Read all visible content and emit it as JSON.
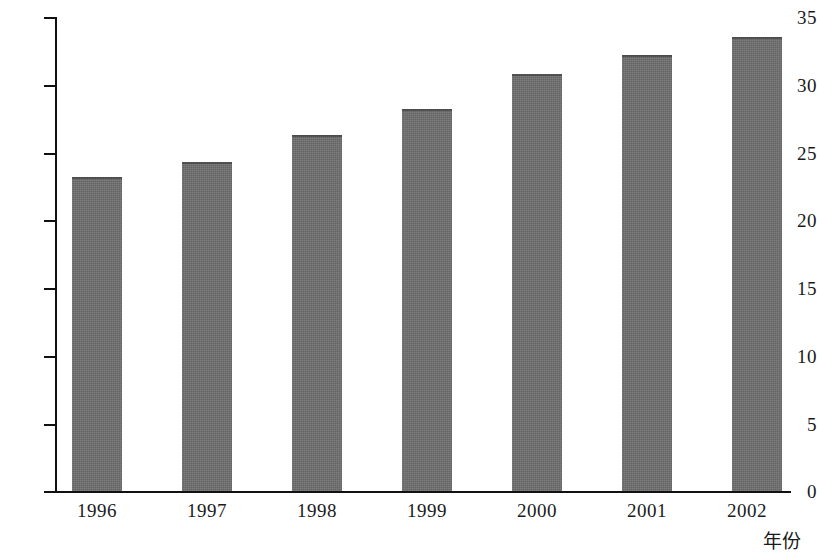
{
  "chart_data": {
    "type": "bar",
    "title": "",
    "subtitle": "",
    "xlabel": "年份",
    "ylabel": "",
    "categories": [
      "1996",
      "1997",
      "1998",
      "1999",
      "2000",
      "2001",
      "2002"
    ],
    "values": [
      23.2,
      24.3,
      26.3,
      28.2,
      30.8,
      32.2,
      33.5
    ],
    "series": [
      {
        "name": "",
        "values": [
          23.2,
          24.3,
          26.3,
          28.2,
          30.8,
          32.2,
          33.5
        ]
      }
    ],
    "ylim": [
      0,
      35
    ],
    "xlim": [
      0,
      7
    ],
    "yticks": [
      0,
      5,
      10,
      15,
      20,
      25,
      30,
      35
    ],
    "ytick_labels": [
      "0",
      "5",
      "10",
      "15",
      "20",
      "25",
      "30",
      "35"
    ],
    "grid": false,
    "legend": false,
    "legend_position": "none",
    "bar_color": "#6e6e6e",
    "axis_color": "#111111",
    "background_color": "#ffffff"
  },
  "axis": {
    "x_title": "年份"
  }
}
